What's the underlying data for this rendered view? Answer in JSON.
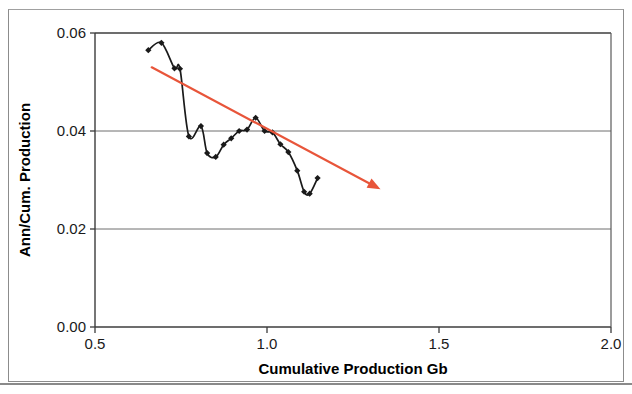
{
  "chart_data": {
    "type": "line",
    "title": "",
    "subtitle": "",
    "xlabel": "Cumulative Production Gb",
    "ylabel": "Ann/Cum. Production",
    "xlim": [
      0.5,
      2.0
    ],
    "ylim": [
      0.0,
      0.06
    ],
    "xticks": [
      "0.5",
      "1.0",
      "1.5",
      "2.0"
    ],
    "xtick_values": [
      0.5,
      1.0,
      1.5,
      2.0
    ],
    "yticks": [
      "0.00",
      "0.02",
      "0.04",
      "0.06"
    ],
    "ytick_values": [
      0.0,
      0.02,
      0.04,
      0.06
    ],
    "grid": "horizontal",
    "legend": "none",
    "series": [
      {
        "name": "Ann/Cum. Production",
        "marker": "diamond",
        "color": "#1a1a1a",
        "x": [
          0.655,
          0.693,
          0.731,
          0.747,
          0.773,
          0.808,
          0.826,
          0.851,
          0.874,
          0.896,
          0.919,
          0.942,
          0.967,
          0.993,
          1.016,
          1.039,
          1.062,
          1.088,
          1.108,
          1.124,
          1.147
        ],
        "y": [
          0.0565,
          0.058,
          0.0528,
          0.0527,
          0.0389,
          0.041,
          0.0355,
          0.0347,
          0.0372,
          0.0385,
          0.04,
          0.0403,
          0.0427,
          0.04,
          0.0397,
          0.0373,
          0.0357,
          0.0319,
          0.0276,
          0.0272,
          0.0304
        ]
      }
    ],
    "annotations": [
      {
        "name": "trend-arrow",
        "type": "arrow",
        "color": "#E8553A",
        "x_start": 0.665,
        "y_start": 0.053,
        "x_end": 1.33,
        "y_end": 0.0281
      }
    ]
  },
  "axes": {
    "x_title": "Cumulative Production Gb",
    "y_title": "Ann/Cum. Production",
    "x_tick_labels": [
      "0.5",
      "1.0",
      "1.5",
      "2.0"
    ],
    "y_tick_labels": [
      "0.00",
      "0.02",
      "0.04",
      "0.06"
    ]
  }
}
